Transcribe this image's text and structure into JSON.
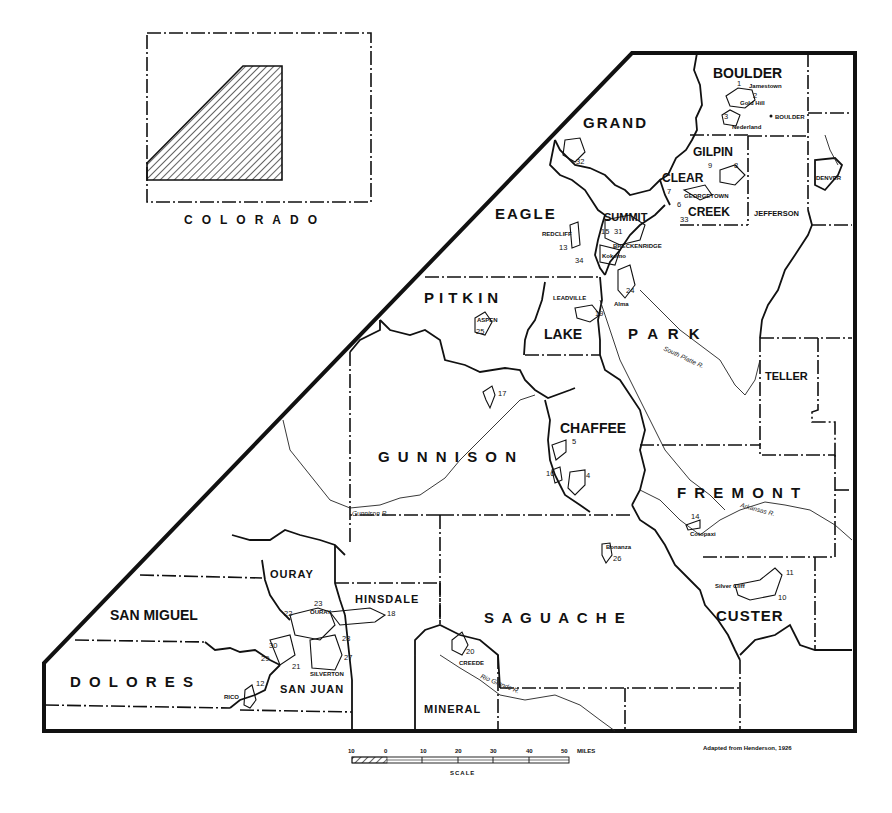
{
  "inset": {
    "label": "COLORADO"
  },
  "counties": [
    {
      "name": "BOULDER"
    },
    {
      "name": "GRAND"
    },
    {
      "name": "GILPIN"
    },
    {
      "name": "CLEAR"
    },
    {
      "name": "CREEK"
    },
    {
      "name": "EAGLE"
    },
    {
      "name": "SUMMIT"
    },
    {
      "name": "JEFFERSON"
    },
    {
      "name": "DENVER"
    },
    {
      "name": "PITKIN"
    },
    {
      "name": "LAKE"
    },
    {
      "name": "P A R K"
    },
    {
      "name": "TELLER"
    },
    {
      "name": "CHAFFEE"
    },
    {
      "name": "G U N N I S O N"
    },
    {
      "name": "F R E M O N T"
    },
    {
      "name": "OURAY"
    },
    {
      "name": "HINSDALE"
    },
    {
      "name": "SAN MIGUEL"
    },
    {
      "name": "S A G U A C H E"
    },
    {
      "name": "CUSTER"
    },
    {
      "name": "D O L O R E S"
    },
    {
      "name": "SAN JUAN"
    },
    {
      "name": "MINERAL"
    }
  ],
  "towns": [
    {
      "name": "Jamestown"
    },
    {
      "name": "Gold Hill"
    },
    {
      "name": "BOULDER"
    },
    {
      "name": "Nederland"
    },
    {
      "name": "GEORGETOWN"
    },
    {
      "name": "REDCLIFF"
    },
    {
      "name": "BRECKENRIDGE"
    },
    {
      "name": "Kokomo"
    },
    {
      "name": "LEADVILLE"
    },
    {
      "name": "Alma"
    },
    {
      "name": "ASPEN"
    },
    {
      "name": "Cotopaxi"
    },
    {
      "name": "Bonanza"
    },
    {
      "name": "Silver Cliff"
    },
    {
      "name": "OURAY"
    },
    {
      "name": "SILVERTON"
    },
    {
      "name": "CREEDE"
    },
    {
      "name": "RICO"
    }
  ],
  "districts": [
    "1",
    "2",
    "3",
    "4",
    "5",
    "6",
    "7",
    "8",
    "9",
    "10",
    "11",
    "12",
    "13",
    "14",
    "15",
    "16",
    "17",
    "18",
    "19",
    "20",
    "21",
    "22",
    "23",
    "24",
    "25",
    "26",
    "27",
    "28",
    "29",
    "30",
    "31",
    "32",
    "33",
    "34"
  ],
  "rivers": [
    {
      "name": "South Platte R."
    },
    {
      "name": "Arkansas R."
    },
    {
      "name": "Gunnison R."
    },
    {
      "name": "Rio Grande R."
    }
  ],
  "scale": {
    "ticks": [
      "10",
      "0",
      "10",
      "20",
      "30",
      "40",
      "50"
    ],
    "unit": "MILES",
    "label": "SCALE"
  },
  "credit": "Adapted from Henderson, 1926"
}
